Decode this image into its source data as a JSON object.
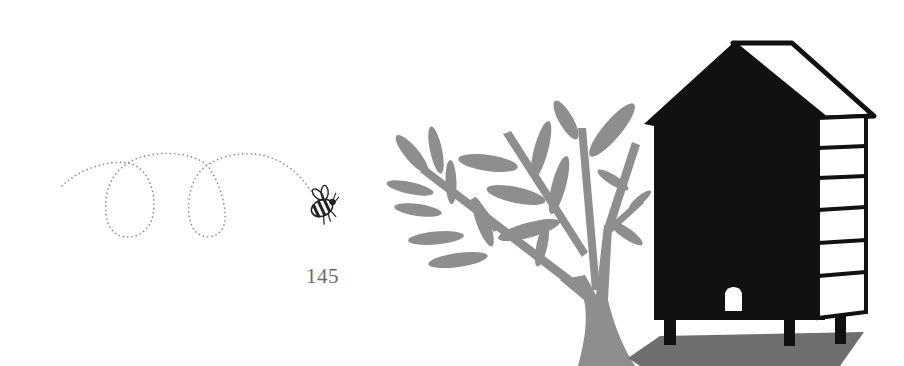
{
  "page": {
    "number": "145"
  },
  "illustration": {
    "elements": [
      "bee-flight-path",
      "bee",
      "tree",
      "beehive",
      "shadow"
    ],
    "colors": {
      "background": "#ffffff",
      "tree": "#8e8e8e",
      "hive": "#111111",
      "shadow": "#6f6f6f",
      "path_dots": "#8a8a8a",
      "page_number": "#6a6a6a"
    }
  }
}
